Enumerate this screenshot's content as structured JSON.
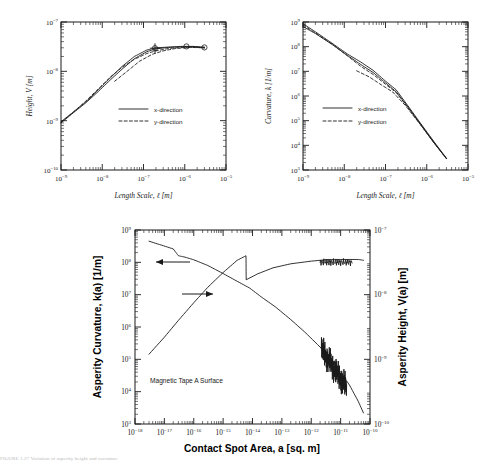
{
  "figure": {
    "caption": "FIGURE 1.27   Variation of asperity height and curvature"
  },
  "chart_data": [
    {
      "id": "height-vs-length-scale",
      "type": "line",
      "title": "",
      "xlabel": "Length Scale, ℓ [m]",
      "ylabel": "Height, V [m]",
      "xscale": "log",
      "yscale": "log",
      "xlim": [
        1e-09,
        1e-05
      ],
      "ylim": [
        1e-10,
        1e-07
      ],
      "xticks": [
        "10-9",
        "10-8",
        "10-7",
        "10-6",
        "10-5"
      ],
      "yticks": [
        "10-7",
        "10-8",
        "10-9",
        "10-10"
      ],
      "grid": false,
      "legend_position": "center",
      "legend": [
        "x-direction",
        "y-direction"
      ],
      "series": [
        {
          "name": "x-direction",
          "style": "solid",
          "x": [
            1e-09,
            2e-09,
            4e-09,
            8e-09,
            1.6e-08,
            3e-08,
            6e-08,
            1.2e-07,
            2e-07,
            4e-07,
            8e-07,
            1.6e-06,
            3e-06
          ],
          "y": [
            9.5e-10,
            1.5e-09,
            2.4e-09,
            4.2e-09,
            7.5e-09,
            1.25e-08,
            2e-08,
            2.7e-08,
            3e-08,
            3.1e-08,
            3.2e-08,
            3.2e-08,
            3.1e-08
          ]
        },
        {
          "name": "x-direction-2",
          "style": "solid",
          "x": [
            1e-09,
            2e-09,
            4e-09,
            8e-09,
            1.6e-08,
            3e-08,
            6e-08,
            1.2e-07,
            2e-07,
            4e-07,
            8e-07,
            1.6e-06,
            3e-06
          ],
          "y": [
            9e-10,
            1.45e-09,
            2.3e-09,
            3.9e-09,
            6.8e-09,
            1.1e-08,
            1.8e-08,
            2.5e-08,
            2.85e-08,
            3.05e-08,
            3.15e-08,
            3.15e-08,
            3e-08
          ]
        },
        {
          "name": "y-direction",
          "style": "dashed",
          "x": [
            1e-09,
            2e-09,
            4e-09,
            8e-09,
            1.6e-08,
            3e-08,
            6e-08,
            1.2e-07,
            2e-07,
            4e-07,
            8e-07,
            1.6e-06,
            3e-06
          ],
          "y": [
            9.2e-10,
            1.5e-09,
            2.5e-09,
            4.4e-09,
            7.8e-09,
            1.2e-08,
            1.75e-08,
            2.3e-08,
            2.6e-08,
            2.9e-08,
            3.05e-08,
            3.1e-08,
            3e-08
          ]
        },
        {
          "name": "y-direction-branch",
          "style": "dashed",
          "x": [
            2e-08,
            4e-08,
            8e-08,
            1.6e-07,
            3e-07,
            6e-07,
            1.4e-06,
            3e-06
          ],
          "y": [
            6.3e-09,
            1e-08,
            1.6e-08,
            2.2e-08,
            2.6e-08,
            2.9e-08,
            3.05e-08,
            3e-08
          ]
        }
      ]
    },
    {
      "id": "curvature-vs-length-scale",
      "type": "line",
      "title": "",
      "xlabel": "Length Scale, ℓ [m]",
      "ylabel": "Curvature, k [1/m]",
      "xscale": "log",
      "yscale": "log",
      "xlim": [
        1e-09,
        1e-05
      ],
      "ylim": [
        1000.0,
        1000000000.0
      ],
      "xticks": [
        "10-9",
        "10-8",
        "10-7",
        "10-6",
        "10-5"
      ],
      "yticks": [
        "109",
        "108",
        "107",
        "106",
        "105",
        "104",
        "103"
      ],
      "grid": false,
      "legend_position": "center-left",
      "legend": [
        "x-direction",
        "y-direction"
      ],
      "series": [
        {
          "name": "x-direction",
          "style": "solid",
          "x": [
            1e-09,
            2e-09,
            5e-09,
            1.2e-08,
            2.5e-08,
            5e-08,
            1e-07,
            1.8e-07,
            3.5e-07,
            7e-07,
            1.5e-06,
            3e-06
          ],
          "y": [
            850000000.0,
            400000000.0,
            140000000.0,
            50000000.0,
            24000000.0,
            11000000.0,
            4000000.0,
            1800000.0,
            400000.0,
            80000.0,
            14000.0,
            3000.0
          ]
        },
        {
          "name": "x-direction-2",
          "style": "solid",
          "x": [
            1e-09,
            2e-09,
            5e-09,
            1.2e-08,
            2.5e-08,
            5e-08,
            1e-07,
            1.8e-07,
            3.5e-07,
            7e-07,
            1.5e-06,
            3e-06
          ],
          "y": [
            650000000.0,
            340000000.0,
            125000000.0,
            44000000.0,
            19000000.0,
            9000000.0,
            3400000.0,
            1500000.0,
            360000.0,
            74000.0,
            13000.0,
            2900.0
          ]
        },
        {
          "name": "y-direction",
          "style": "dashed",
          "x": [
            1e-09,
            2e-09,
            5e-09,
            1.2e-08,
            2.5e-08,
            5e-08,
            1e-07,
            1.8e-07,
            3.5e-07,
            7e-07,
            1.5e-06,
            3e-06
          ],
          "y": [
            750000000.0,
            360000000.0,
            130000000.0,
            42000000.0,
            16000000.0,
            7500000.0,
            3000000.0,
            1400000.0,
            340000.0,
            70000.0,
            12500.0,
            2900.0
          ]
        },
        {
          "name": "y-direction-branch",
          "style": "dashed",
          "x": [
            2e-08,
            4e-08,
            8e-08,
            1.5e-07,
            3e-07,
            7e-07,
            1.5e-06,
            3e-06
          ],
          "y": [
            10500000.0,
            6000000.0,
            2800000.0,
            1450000.0,
            420000.0,
            70000.0,
            12500.0,
            2900.0
          ]
        }
      ]
    },
    {
      "id": "asperity-curvature-height-vs-contact-area",
      "type": "line",
      "title": "",
      "annotation": "Magnetic Tape A Surface",
      "xlabel": "Contact Spot Area, a [sq. m]",
      "ylabel": "Asperity Curvature, k(a)  [1/m]",
      "ylabel_right": "Asperity Height, V(a)  [m]",
      "xscale": "log",
      "yscale": "log",
      "xlim": [
        1e-18,
        1e-10
      ],
      "ylim": [
        1000.0,
        1000000000.0
      ],
      "ylim_right": [
        1e-10,
        1e-07
      ],
      "xticks": [
        "10-18",
        "10-17",
        "10-16",
        "10-15",
        "10-14",
        "10-13",
        "10-12",
        "10-11",
        "10-10"
      ],
      "yticks": [
        "109",
        "108",
        "107",
        "106",
        "105",
        "104",
        "103"
      ],
      "yticks_right": [
        "10-7",
        "10-8",
        "10-9",
        "10-10"
      ],
      "grid": false,
      "arrow_left_label": "points to curvature curve (left axis)",
      "arrow_right_label": "points to height curve (right axis)",
      "series": [
        {
          "name": "Asperity Curvature, k(a)",
          "axis": "left",
          "style": "solid",
          "x": [
            3e-18,
            8e-18,
            2e-17,
            3e-17,
            5e-17,
            1e-16,
            3e-16,
            1e-15,
            3e-15,
            8e-15,
            2e-14,
            6e-14,
            2e-13,
            6e-13,
            2e-12,
            5e-12,
            1e-11,
            2e-11,
            4e-11,
            6e-11
          ],
          "y": [
            450000000.0,
            340000000.0,
            260000000.0,
            160000000.0,
            145000000.0,
            120000000.0,
            80000000.0,
            45000000.0,
            26000000.0,
            16000000.0,
            8500000.0,
            4200000.0,
            1700000.0,
            700000.0,
            240000.0,
            100000.0,
            40000.0,
            16000.0,
            5000.0,
            2200.0
          ]
        },
        {
          "name": "Asperity Height, V(a)",
          "axis": "right",
          "style": "solid",
          "x": [
            3e-18,
            1e-17,
            3e-17,
            1e-16,
            3e-16,
            1e-15,
            3e-15,
            6e-15,
            6.1e-15,
            1.5e-14,
            5e-14,
            2e-13,
            1e-12,
            4e-12,
            1.5e-11,
            4e-11,
            6e-11
          ],
          "y": [
            1.2e-09,
            2.2e-09,
            4e-09,
            7.5e-09,
            1.3e-08,
            2.2e-08,
            3.4e-08,
            4e-08,
            1.7e-08,
            2.1e-08,
            2.6e-08,
            3e-08,
            3.3e-08,
            3.5e-08,
            3.5e-08,
            3.5e-08,
            3.4e-08
          ]
        }
      ]
    }
  ]
}
